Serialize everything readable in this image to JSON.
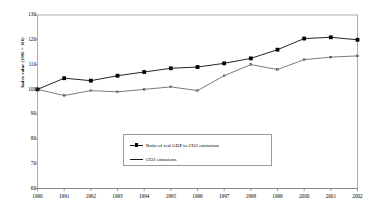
{
  "chart_data": {
    "type": "line",
    "title": "",
    "xlabel": "",
    "ylabel": "Index value (1990 = 100)",
    "x": [
      1990,
      1991,
      1992,
      1993,
      1994,
      1995,
      1996,
      1997,
      1998,
      1999,
      2000,
      2001,
      2002
    ],
    "xtick_labels": [
      "1990",
      "1991",
      "1992",
      "1993",
      "1994",
      "1995",
      "1996",
      "1997",
      "1998",
      "1999",
      "2000",
      "2001",
      "2002"
    ],
    "ytick_labels": [
      "60",
      "70",
      "80",
      "90",
      "100",
      "110",
      "120",
      "130"
    ],
    "yticks": [
      60,
      70,
      80,
      90,
      100,
      110,
      120,
      130
    ],
    "ylim": [
      60,
      130
    ],
    "grid": false,
    "legend_position": "inside-bottom-center",
    "series": [
      {
        "name": "Ratio of real GDP to CO2 emissions",
        "marker": "square",
        "color": "#000000",
        "values": [
          100.0,
          104.5,
          103.5,
          105.5,
          107.0,
          108.5,
          109.0,
          110.5,
          112.5,
          116.0,
          120.5,
          121.0,
          120.0
        ]
      },
      {
        "name": "CO2 emissions",
        "marker": "none",
        "color": "#333333",
        "values": [
          100.0,
          97.5,
          99.5,
          99.0,
          100.0,
          101.0,
          99.5,
          105.5,
          110.0,
          108.0,
          112.0,
          113.0,
          113.5
        ]
      }
    ]
  },
  "legend": {
    "entries": [
      {
        "label": "Ratio of real GDP to CO2 emissions"
      },
      {
        "label": "CO2 emissions"
      }
    ]
  },
  "axes": {
    "y_title": "Index value (1990 = 100)"
  }
}
